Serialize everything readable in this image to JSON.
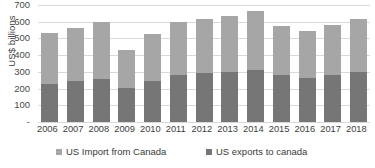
{
  "chart_data": {
    "type": "bar",
    "stacked": true,
    "title": "",
    "xlabel": "",
    "ylabel": "US$ billions",
    "ylim": [
      0,
      700
    ],
    "ytick_labels": [
      "700",
      "600",
      "500",
      "400",
      "300",
      "200",
      "100",
      "-"
    ],
    "ytick_values": [
      700,
      600,
      500,
      400,
      300,
      200,
      100,
      0
    ],
    "grid": true,
    "legend_position": "bottom",
    "categories": [
      "2006",
      "2007",
      "2008",
      "2009",
      "2010",
      "2011",
      "2012",
      "2013",
      "2014",
      "2015",
      "2016",
      "2017",
      "2018"
    ],
    "series": [
      {
        "name": "US exports to canada",
        "color": "#767676",
        "values": [
          228,
          245,
          258,
          205,
          247,
          281,
          292,
          301,
          312,
          280,
          266,
          282,
          299
        ]
      },
      {
        "name": "US Import from Canada",
        "color": "#a6a6a6",
        "values": [
          302,
          316,
          340,
          223,
          277,
          316,
          324,
          332,
          350,
          295,
          277,
          300,
          318
        ]
      }
    ],
    "totals": [
      530,
      561,
      598,
      428,
      524,
      597,
      616,
      633,
      662,
      575,
      543,
      582,
      617
    ]
  },
  "legend": {
    "items": [
      {
        "label": "US Import from Canada",
        "color": "#a6a6a6",
        "marker": "square-swatch-icon"
      },
      {
        "label": "US exports to canada",
        "color": "#767676",
        "marker": "square-swatch-icon"
      }
    ]
  }
}
